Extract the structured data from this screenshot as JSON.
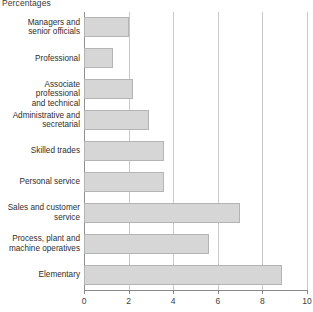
{
  "chart_data": {
    "type": "bar",
    "orientation": "horizontal",
    "title": "Percentages",
    "xlabel": "",
    "ylabel": "",
    "xlim": [
      0,
      10
    ],
    "xticks": [
      "0",
      "2",
      "4",
      "6",
      "8",
      "10"
    ],
    "xtick_values": [
      0,
      2,
      4,
      6,
      8,
      10
    ],
    "grid": true,
    "grid_axis": "x",
    "legend": false,
    "categories": [
      "Managers and\nsenior officials",
      "Professional",
      "Associate professional\nand technical",
      "Administrative and\nsecretarial",
      "Skilled trades",
      "Personal service",
      "Sales and customer\nservice",
      "Process, plant and\nmachine operatives",
      "Elementary"
    ],
    "values": [
      2.0,
      1.3,
      2.2,
      2.9,
      3.6,
      3.6,
      7.0,
      5.6,
      8.9
    ],
    "bar_color": "#d6d6d6",
    "bar_border_color": "#b4b4b4",
    "axis_color": "#8a8a8a",
    "grid_color": "#c8c8c8"
  }
}
